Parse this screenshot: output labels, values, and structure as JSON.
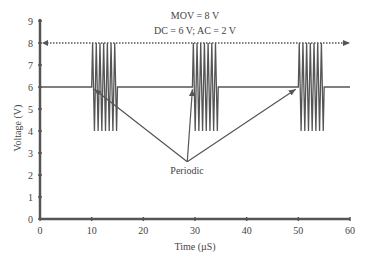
{
  "chart_data": {
    "type": "line",
    "title": "",
    "annotations": [
      {
        "text": "MOV = 8 V",
        "x": 30,
        "y": 8.6
      },
      {
        "text": "DC = 6 V; AC = 2 V",
        "x": 30,
        "y": 8.15
      },
      {
        "text": "Periodic",
        "x": 28.5,
        "y": 2.2
      }
    ],
    "xlabel": "Time (µS)",
    "ylabel": "Voltage (V)",
    "xlim": [
      0,
      60
    ],
    "ylim": [
      0,
      9
    ],
    "xticks": [
      0,
      10,
      20,
      30,
      40,
      50,
      60
    ],
    "yticks": [
      0,
      1,
      2,
      3,
      4,
      5,
      6,
      7,
      8,
      9
    ],
    "grid": false,
    "legend": null,
    "reference_line": {
      "label": "MOV",
      "y": 8,
      "style": "dotted",
      "x_from": 0,
      "x_to": 60
    },
    "series": [
      {
        "name": "Signal",
        "dc_level": 6,
        "ac_amplitude": 2,
        "bursts": [
          {
            "start": 10,
            "end": 15
          },
          {
            "start": 29.5,
            "end": 34.5
          },
          {
            "start": 50,
            "end": 55
          }
        ]
      }
    ],
    "arrows": [
      {
        "from": [
          28.5,
          2.6
        ],
        "to": [
          10.5,
          5.9
        ]
      },
      {
        "from": [
          28.5,
          2.6
        ],
        "to": [
          29.5,
          5.9
        ]
      },
      {
        "from": [
          28.5,
          2.6
        ],
        "to": [
          49.5,
          5.9
        ]
      }
    ]
  }
}
